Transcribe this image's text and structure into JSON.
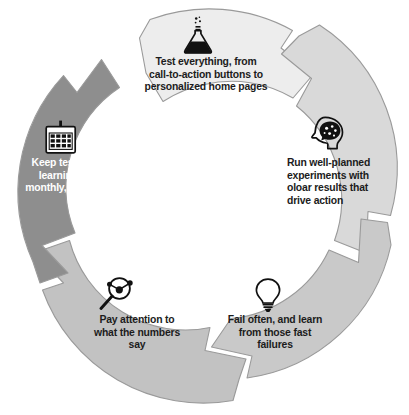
{
  "diagram": {
    "type": "cyclical-arrow-process",
    "title": "",
    "direction": "clockwise",
    "segment_count": 5,
    "colors": {
      "segment_lightest": "#ededed",
      "segment_light": "#d9d9d9",
      "segment_mid": "#c9c9c9",
      "segment_mid_dark": "#c2c2c2",
      "segment_dark": "#8e8e8e",
      "outline": "#9a9a9a",
      "gap": "#ffffff",
      "text_dark": "#1c1c1c",
      "text_light": "#ffffff",
      "icon_dark": "#111111",
      "page_background": "#ffffff"
    },
    "segments": [
      {
        "id": "test-everything",
        "position": "top",
        "order": 1,
        "icon": "flask-icon",
        "fill": "#ededed",
        "text_color": "#1c1c1c",
        "label": "Test everything, from\ncall-to-action buttons to\npersonalized home pages"
      },
      {
        "id": "run-experiments",
        "position": "right",
        "order": 2,
        "icon": "head-brain-icon",
        "fill": "#d9d9d9",
        "text_color": "#1c1c1c",
        "label": "Run well-planned\nexperiments with\noloar results that\ndrive action"
      },
      {
        "id": "fail-often",
        "position": "bottom-right",
        "order": 3,
        "icon": "lightbulb-icon",
        "fill": "#c9c9c9",
        "text_color": "#1c1c1c",
        "label": "Fail often, and learn\nfrom those fast\nfailures"
      },
      {
        "id": "pay-attention",
        "position": "bottom-left",
        "order": 4,
        "icon": "magnifying-glass-data-icon",
        "fill": "#c2c2c2",
        "text_color": "#1c1c1c",
        "label": "Pay attention to\nwhat the numbers\nsay"
      },
      {
        "id": "keep-testing",
        "position": "left",
        "order": 5,
        "icon": "calendar-icon",
        "fill": "#8e8e8e",
        "text_color": "#ffffff",
        "label": "Keep testing and\nlearning daily,\nmonthly, and yearly"
      }
    ]
  }
}
